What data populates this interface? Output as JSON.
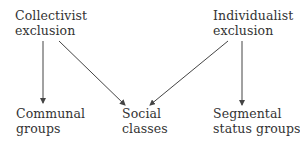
{
  "diagram": {
    "type": "directed-graph",
    "colors": {
      "text": "#333333",
      "edge": "#444444",
      "background": "#ffffff"
    },
    "nodes": {
      "collectivist": {
        "line1": "Collectivist",
        "line2": "exclusion"
      },
      "individualist": {
        "line1": "Individualist",
        "line2": "exclusion"
      },
      "communal": {
        "line1": "Communal",
        "line2": "groups"
      },
      "social": {
        "line1": "Social",
        "line2": "classes"
      },
      "segmental": {
        "line1": "Segmental",
        "line2": "status groups"
      }
    },
    "edges": [
      {
        "from": "Collectivist exclusion",
        "to": "Communal groups"
      },
      {
        "from": "Collectivist exclusion",
        "to": "Social classes"
      },
      {
        "from": "Individualist exclusion",
        "to": "Social classes"
      },
      {
        "from": "Individualist exclusion",
        "to": "Segmental status groups"
      }
    ]
  }
}
